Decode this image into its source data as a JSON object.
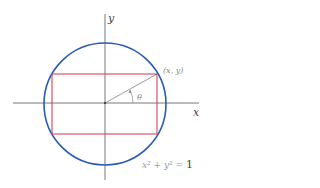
{
  "diagram": {
    "axes": {
      "x_label": "x",
      "y_label": "y",
      "color": "#555555"
    },
    "circle": {
      "equation_lhs": "x² + y² = ",
      "equation_rhs": "1",
      "color": "#2a5bb5"
    },
    "rectangle": {
      "color": "#d9445a"
    },
    "point": {
      "label": "(x, y)"
    },
    "angle": {
      "label": "θ"
    }
  }
}
